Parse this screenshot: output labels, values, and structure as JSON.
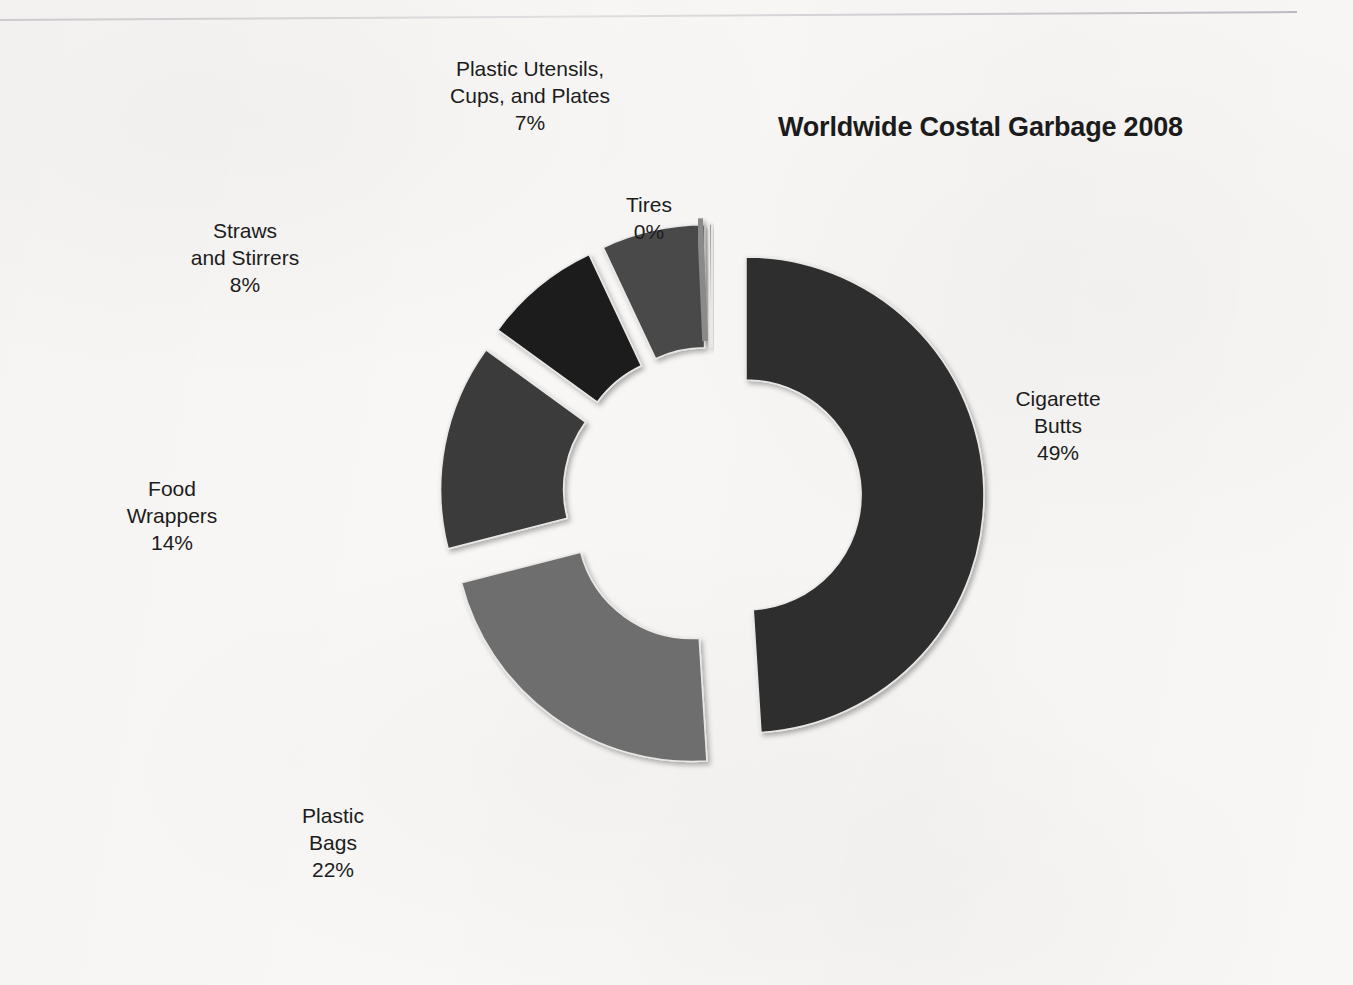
{
  "document": {
    "title": "Worldwide Costal Garbage 2008",
    "background_color": "#f8f7f5",
    "has_top_rule": true
  },
  "chart_data": {
    "type": "pie",
    "variant": "exploded-doughnut",
    "title": "Worldwide Costal Garbage 2008",
    "subtitle": "",
    "xlabel": "",
    "ylabel": "",
    "legend_position": "none",
    "labels_placement": "outside-callout",
    "label_format": "category name on one or two lines, percentage below",
    "grid": false,
    "units": "percent",
    "total": 100,
    "categories": [
      "Cigarette Butts",
      "Plastic Bags",
      "Food Wrappers",
      "Straws and Stirrers",
      "Plastic Utensils, Cups, and Plates",
      "Tires"
    ],
    "values": [
      49,
      22,
      14,
      8,
      7,
      0
    ],
    "colors": [
      "#2e2e2e",
      "#6e6e6e",
      "#3a3a3a",
      "#1c1c1c",
      "#4a4a4a",
      "#8a8a8a"
    ],
    "slices": [
      {
        "name": "Cigarette Butts",
        "label_line1": "Cigarette",
        "label_line2": "Butts",
        "percent_text": "49%",
        "value": 49,
        "color": "#2e2e2e",
        "start_angle": 0,
        "end_angle": 176.4
      },
      {
        "name": "Plastic Bags",
        "label_line1": "Plastic",
        "label_line2": "Bags",
        "percent_text": "22%",
        "value": 22,
        "color": "#6e6e6e",
        "start_angle": 176.4,
        "end_angle": 255.6
      },
      {
        "name": "Food Wrappers",
        "label_line1": "Food",
        "label_line2": "Wrappers",
        "percent_text": "14%",
        "value": 14,
        "color": "#3a3a3a",
        "start_angle": 255.6,
        "end_angle": 306.0
      },
      {
        "name": "Straws and Stirrers",
        "label_line1": "Straws",
        "label_line2": "and Stirrers",
        "percent_text": "8%",
        "value": 8,
        "color": "#1c1c1c",
        "start_angle": 306.0,
        "end_angle": 334.8
      },
      {
        "name": "Plastic Utensils, Cups, and Plates",
        "label_line1": "Plastic Utensils,",
        "label_line2": "Cups, and Plates",
        "percent_text": "7%",
        "value": 7,
        "color": "#4a4a4a",
        "start_angle": 334.8,
        "end_angle": 360.0
      },
      {
        "name": "Tires",
        "label_line1": "Tires",
        "label_line2": "",
        "percent_text": "0%",
        "value": 0,
        "color": "#8a8a8a",
        "start_angle": 359.4,
        "end_angle": 360.0
      }
    ]
  }
}
